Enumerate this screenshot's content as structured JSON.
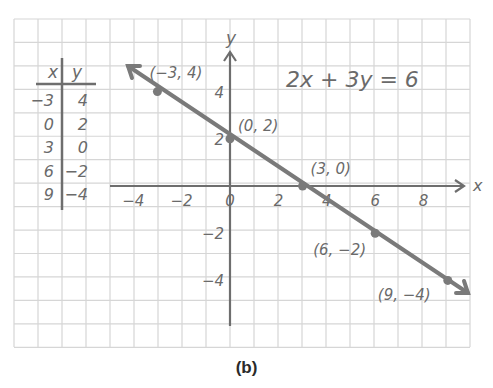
{
  "chart_data": {
    "type": "line",
    "title": "2x + 3y = 6",
    "xlabel": "x",
    "ylabel": "y",
    "x": [
      -3,
      0,
      3,
      6,
      9
    ],
    "series": [
      {
        "name": "2x + 3y = 6",
        "values": [
          4,
          2,
          0,
          -2,
          -4
        ]
      }
    ],
    "points": [
      {
        "x": -3,
        "y": 4,
        "label": "(−3, 4)"
      },
      {
        "x": 0,
        "y": 2,
        "label": "(0, 2)"
      },
      {
        "x": 3,
        "y": 0,
        "label": "(3, 0)"
      },
      {
        "x": 6,
        "y": -2,
        "label": "(6, −2)"
      },
      {
        "x": 9,
        "y": -4,
        "label": "(9, −4)"
      }
    ],
    "xticks": [
      "−4",
      "−2",
      "0",
      "2",
      "4",
      "6",
      "8"
    ],
    "yticks": [
      "4",
      "2",
      "−2",
      "−4"
    ],
    "xlim": [
      -5,
      10
    ],
    "ylim": [
      -6,
      5
    ],
    "grid": true,
    "legend": "none"
  },
  "table": {
    "headers": [
      "x",
      "y"
    ],
    "rows": [
      [
        "−3",
        "4"
      ],
      [
        "0",
        "2"
      ],
      [
        "3",
        "0"
      ],
      [
        "6",
        "−2"
      ],
      [
        "9",
        "−4"
      ]
    ]
  },
  "equation": "2x + 3y = 6",
  "axis_labels": {
    "x": "x",
    "y": "y"
  },
  "caption": "(b)",
  "colors": {
    "grid": "#d4d4d4",
    "ink": "#6e6e6e",
    "line": "#7a7a7a"
  }
}
